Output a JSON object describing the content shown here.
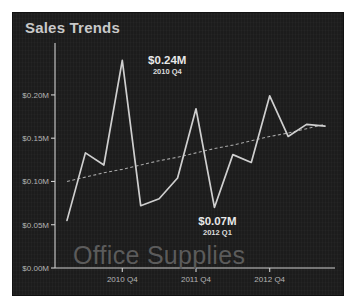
{
  "card": {
    "title": "Sales Trends",
    "watermark": "Office Supplies"
  },
  "annotations": {
    "max": {
      "value": "$0.24M",
      "label": "2010 Q4"
    },
    "min": {
      "value": "$0.07M",
      "label": "2012 Q1"
    }
  },
  "chart_data": {
    "type": "line",
    "title": "Sales Trends",
    "xlabel": "",
    "ylabel": "",
    "ylim": [
      0,
      0.26
    ],
    "ytick_labels": [
      "$0.00M",
      "$0.05M",
      "$0.10M",
      "$0.15M",
      "$0.20M"
    ],
    "ytick_values": [
      0.0,
      0.05,
      0.1,
      0.15,
      0.2
    ],
    "xtick_labels": [
      "2010 Q4",
      "2011 Q4",
      "2012 Q4"
    ],
    "xtick_indices": [
      3,
      7,
      11
    ],
    "grid": false,
    "legend": false,
    "categories": [
      "2010 Q1",
      "2010 Q2",
      "2010 Q3",
      "2010 Q4",
      "2011 Q1",
      "2011 Q2",
      "2011 Q3",
      "2011 Q4",
      "2012 Q1",
      "2012 Q2",
      "2012 Q3",
      "2012 Q4",
      "2013 Q1",
      "2013 Q2",
      "2013 Q3"
    ],
    "series": [
      {
        "name": "Office Supplies",
        "values": [
          0.055,
          0.133,
          0.119,
          0.24,
          0.072,
          0.08,
          0.104,
          0.184,
          0.07,
          0.131,
          0.122,
          0.199,
          0.152,
          0.166,
          0.164
        ]
      },
      {
        "name": "Trend",
        "style": "dashed",
        "values": [
          0.1,
          0.105,
          0.11,
          0.114,
          0.119,
          0.124,
          0.128,
          0.133,
          0.138,
          0.142,
          0.147,
          0.152,
          0.156,
          0.161,
          0.166
        ]
      }
    ],
    "annotated_points": [
      {
        "category": "2010 Q4",
        "value": 0.24,
        "value_label": "$0.24M",
        "kind": "max"
      },
      {
        "category": "2012 Q1",
        "value": 0.07,
        "value_label": "$0.07M",
        "kind": "min"
      }
    ],
    "colors": {
      "background": "#1c1c1c",
      "series": "#cfcfcf",
      "trend": "#a8a8a8",
      "text": "#c9c9c9",
      "watermark": "#5b5b5b"
    }
  }
}
